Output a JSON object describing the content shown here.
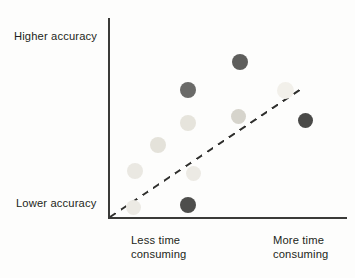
{
  "chart_data": {
    "type": "scatter",
    "title": "",
    "xlabel": "",
    "ylabel": "",
    "xlim": [
      0,
      100
    ],
    "ylim": [
      0,
      100
    ],
    "grid": false,
    "legend": null,
    "axis_annotations": {
      "y_top": "Higher accuracy",
      "y_bottom": "Lower accuracy",
      "x_left": "Less time\nconsuming",
      "x_right": "More time\nconsuming"
    },
    "trendline": {
      "style": "dashed",
      "color": "#2e2e2c",
      "x": [
        0,
        100
      ],
      "y": [
        0,
        100
      ]
    },
    "points": [
      {
        "x": 12,
        "y": 5,
        "shade": "#eceae4",
        "size": 15,
        "px": 133,
        "py": 207
      },
      {
        "x": 13,
        "y": 24,
        "shade": "#eae8e2",
        "size": 16,
        "px": 135,
        "py": 171
      },
      {
        "x": 25,
        "y": 37,
        "shade": "#e4e2da",
        "size": 16,
        "px": 158,
        "py": 145
      },
      {
        "x": 40,
        "y": 6,
        "shade": "#4e4e4c",
        "size": 16,
        "px": 188,
        "py": 205
      },
      {
        "x": 43,
        "y": 23,
        "shade": "#eceae4",
        "size": 15,
        "px": 193,
        "py": 173
      },
      {
        "x": 39,
        "y": 49,
        "shade": "#e6e4dc",
        "size": 16,
        "px": 188,
        "py": 123
      },
      {
        "x": 39,
        "y": 67,
        "shade": "#6a6a68",
        "size": 16,
        "px": 188,
        "py": 90
      },
      {
        "x": 60,
        "y": 84,
        "shade": "#5e5e5c",
        "size": 16,
        "px": 240,
        "py": 62
      },
      {
        "x": 59,
        "y": 53,
        "shade": "#d6d4cc",
        "size": 15,
        "px": 238,
        "py": 116
      },
      {
        "x": 73,
        "y": 65,
        "shade": "#f2f0ea",
        "size": 17,
        "px": 285,
        "py": 90
      },
      {
        "x": 83,
        "y": 50,
        "shade": "#4a4a48",
        "size": 15,
        "px": 305,
        "py": 120
      }
    ]
  },
  "labels": {
    "higher_accuracy": "Higher accuracy",
    "lower_accuracy": "Lower accuracy",
    "less_time": "Less time\nconsuming",
    "more_time": "More time\nconsuming"
  },
  "colors": {
    "axis": "#3a3a38",
    "trend": "#2e2e2c",
    "text": "#231f20",
    "background": "#fdfdfc"
  }
}
